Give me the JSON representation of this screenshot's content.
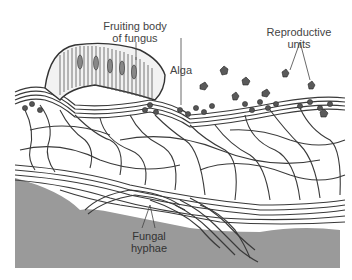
{
  "figure": {
    "colors": {
      "substrate": "#9a9a9a",
      "hyphae_stroke": "#3a3a3a",
      "hyphae_fill": "#e8e8e8",
      "alga": "#555555",
      "label_text": "#444444",
      "background": "#ffffff"
    }
  },
  "labels": {
    "fruiting_body_line1": "Fruiting body",
    "fruiting_body_line2": "of fungus",
    "alga": "Alga",
    "reproductive_line1": "Reproductive",
    "reproductive_line2": "units",
    "hyphae_line1": "Fungal",
    "hyphae_line2": "hyphae"
  }
}
